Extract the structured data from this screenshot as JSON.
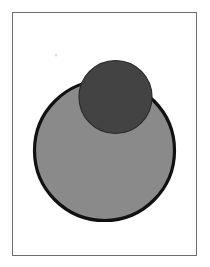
{
  "page": {
    "width": 210,
    "height": 267,
    "background_color": "#ffffff",
    "title": "Two overlapping circles figure"
  },
  "frame": {
    "name": "figure-border",
    "x": 12.5,
    "y": 12.5,
    "width": 184,
    "height": 243,
    "stroke_color": "#6e6e6e",
    "stroke_width": 1,
    "fill_color": "#ffffff"
  },
  "shapes": {
    "large_circle": {
      "label": "large light gray circle",
      "cx": 104.5,
      "cy": 150.5,
      "r": 70,
      "fill_color": "#8a8a8a",
      "stroke_color": "#111111",
      "stroke_width": 3.2
    },
    "small_circle": {
      "label": "small dark gray circle",
      "cx": 115.5,
      "cy": 97,
      "r": 36.5,
      "fill_color": "#434343",
      "stroke_color": "#2a2a2a",
      "stroke_width": 1.2
    }
  },
  "artifacts": {
    "speck": {
      "label": "faint scan speck",
      "cx": 56,
      "cy": 55,
      "r": 1.6,
      "fill_color": "#e2e2e2"
    }
  },
  "palette": {
    "paper_white": "#ffffff",
    "light_gray_fill": "#8a8a8a",
    "dark_gray_fill": "#434343",
    "outline_black": "#111111",
    "frame_gray": "#6e6e6e"
  }
}
